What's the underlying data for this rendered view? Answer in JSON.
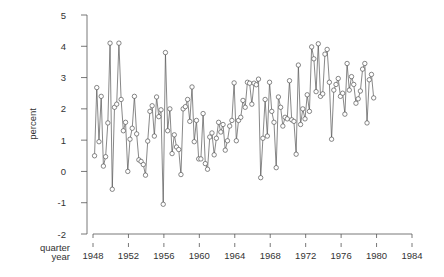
{
  "chart_data": {
    "type": "line",
    "title": "",
    "xlabel": "quarter year",
    "x_label_lines": [
      "quarter",
      "year"
    ],
    "ylabel": "percent",
    "ylim": [
      -2,
      5
    ],
    "xlim": [
      1948,
      1984
    ],
    "yticks": [
      -2,
      -1,
      0,
      1,
      2,
      3,
      4,
      5
    ],
    "xticks": [
      1948,
      1952,
      1956,
      1960,
      1964,
      1968,
      1972,
      1976,
      1980,
      1984
    ],
    "grid": false,
    "legend": "none",
    "marker": "open-circle",
    "x_start": 1948.0,
    "x_step": 0.25,
    "series": [
      {
        "name": "percent",
        "values": [
          0.5,
          2.68,
          0.95,
          2.4,
          0.17,
          0.47,
          1.55,
          4.1,
          -0.57,
          2.05,
          2.15,
          4.1,
          2.3,
          1.3,
          1.57,
          0.0,
          1.03,
          1.38,
          2.4,
          1.2,
          0.37,
          0.32,
          0.22,
          -0.12,
          0.97,
          1.92,
          2.1,
          1.13,
          2.38,
          1.75,
          1.97,
          -1.05,
          3.8,
          1.3,
          2.0,
          0.57,
          1.17,
          0.78,
          0.7,
          -0.1,
          2.0,
          2.07,
          2.3,
          1.6,
          2.7,
          0.95,
          1.63,
          0.4,
          0.4,
          1.85,
          0.25,
          0.07,
          1.1,
          1.23,
          0.53,
          1.06,
          1.57,
          1.26,
          1.5,
          0.68,
          0.98,
          1.45,
          1.63,
          2.83,
          0.98,
          1.63,
          1.73,
          2.27,
          2.05,
          2.85,
          2.82,
          2.15,
          2.82,
          2.77,
          2.95,
          -0.2,
          1.06,
          2.3,
          1.13,
          2.85,
          1.92,
          1.57,
          0.12,
          2.38,
          2.05,
          1.45,
          1.73,
          1.68,
          2.9,
          1.65,
          1.6,
          0.55,
          3.4,
          1.5,
          2.0,
          1.68,
          2.45,
          1.92,
          3.98,
          3.6,
          2.55,
          4.08,
          2.4,
          2.48,
          3.75,
          3.9,
          2.85,
          1.03,
          2.6,
          2.78,
          2.97,
          2.4,
          2.5,
          1.83,
          3.45,
          2.6,
          3.03,
          2.78,
          2.18,
          2.32,
          2.57,
          3.27,
          3.45,
          1.55,
          2.93,
          3.1,
          2.35
        ]
      }
    ]
  }
}
